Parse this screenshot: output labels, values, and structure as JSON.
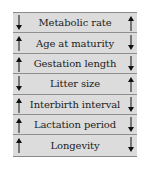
{
  "table": {
    "rows": [
      {
        "label": "Metabolic rate",
        "left": "down",
        "right": "up"
      },
      {
        "label": "Age at maturity",
        "left": "up",
        "right": "down"
      },
      {
        "label": "Gestation length",
        "left": "up",
        "right": "down"
      },
      {
        "label": "Litter size",
        "left": "down",
        "right": "up"
      },
      {
        "label": "Interbirth interval",
        "left": "up",
        "right": "down"
      },
      {
        "label": "Lactation period",
        "left": "up",
        "right": "down"
      },
      {
        "label": "Longevity",
        "left": "up",
        "right": "down"
      }
    ]
  },
  "colors": {
    "background": "#dcdcdc",
    "divider": "#8f8f8f",
    "text": "#222222",
    "arrow": "#111111"
  }
}
